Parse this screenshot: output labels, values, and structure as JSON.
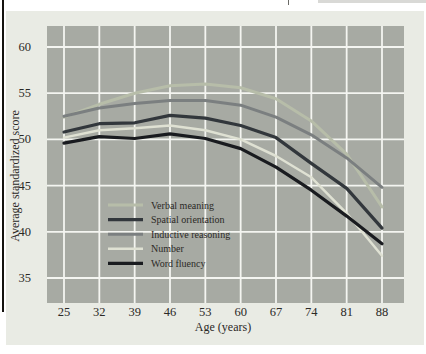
{
  "chart_data": {
    "type": "line",
    "x": [
      25,
      32,
      39,
      46,
      53,
      60,
      67,
      74,
      81,
      88
    ],
    "xticks": [
      25,
      32,
      39,
      46,
      53,
      60,
      67,
      74,
      81,
      88
    ],
    "yticks": [
      60,
      55,
      50,
      45,
      40,
      35
    ],
    "xlabel": "Age (years)",
    "ylabel": "Average standardized score",
    "xlim": [
      21.6,
      92.3
    ],
    "ylim": [
      32.7,
      62.3
    ],
    "grid": true,
    "legend_position": "inside-lower-left",
    "series": [
      {
        "name": "Verbal meaning",
        "color": "#b7bda9",
        "width": 3,
        "values": [
          52.4,
          53.8,
          55.0,
          55.8,
          56.0,
          55.6,
          54.4,
          52.0,
          48.4,
          42.7
        ]
      },
      {
        "name": "Spatial orientation",
        "color": "#32373c",
        "width": 3.2,
        "values": [
          50.8,
          51.7,
          51.8,
          52.6,
          52.3,
          51.5,
          50.2,
          47.4,
          44.7,
          40.4
        ]
      },
      {
        "name": "Inductive reasoning",
        "color": "#7b7f80",
        "width": 3,
        "values": [
          52.5,
          53.4,
          53.9,
          54.2,
          54.2,
          53.7,
          52.4,
          50.5,
          48.0,
          44.8
        ]
      },
      {
        "name": "Number",
        "color": "#dfe1d3",
        "width": 2.5,
        "values": [
          50.2,
          51.0,
          51.2,
          51.5,
          51.0,
          50.0,
          48.2,
          45.9,
          42.0,
          37.4
        ]
      },
      {
        "name": "Word fluency",
        "color": "#191b1f",
        "width": 3.2,
        "values": [
          49.6,
          50.3,
          50.1,
          50.6,
          50.1,
          49.0,
          47.0,
          44.5,
          41.7,
          38.7
        ]
      }
    ],
    "panel_bg": "#a7aaa3",
    "figure_bg": "#e9ebe4",
    "grid_color": "#f4f5f1",
    "text_color": "#2b2926"
  }
}
